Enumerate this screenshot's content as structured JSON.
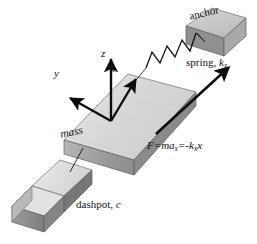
{
  "figure": {
    "background_color": "#ffffff"
  },
  "labels": {
    "anchor": "anchor",
    "spring_text": "spring, ",
    "spring_symbol": "k",
    "spring_subscript": "x",
    "mass": "mass",
    "dashpot": "dashpot, ",
    "dashpot_symbol": "c",
    "force_equation": "F=ma",
    "force_sub1": "x",
    "force_mid": "=-k",
    "force_sub2": "x",
    "force_end": "x"
  },
  "axes": {
    "x": "x",
    "y": "y",
    "z": "z"
  },
  "colors": {
    "top_face": "#d9d9d9",
    "top_face_light": "#e6e6e6",
    "front_face": "#9c9c9c",
    "side_face": "#7f7f7f",
    "anchor_top": "#c9c9c9",
    "anchor_front": "#8e8e8e",
    "anchor_side": "#a8a8a8",
    "dashpot_top": "#dcdcdc",
    "dashpot_front": "#8a8a8a",
    "dashpot_side": "#b4b4b4",
    "outline": "#5a5a5a",
    "ink": "#111111"
  }
}
